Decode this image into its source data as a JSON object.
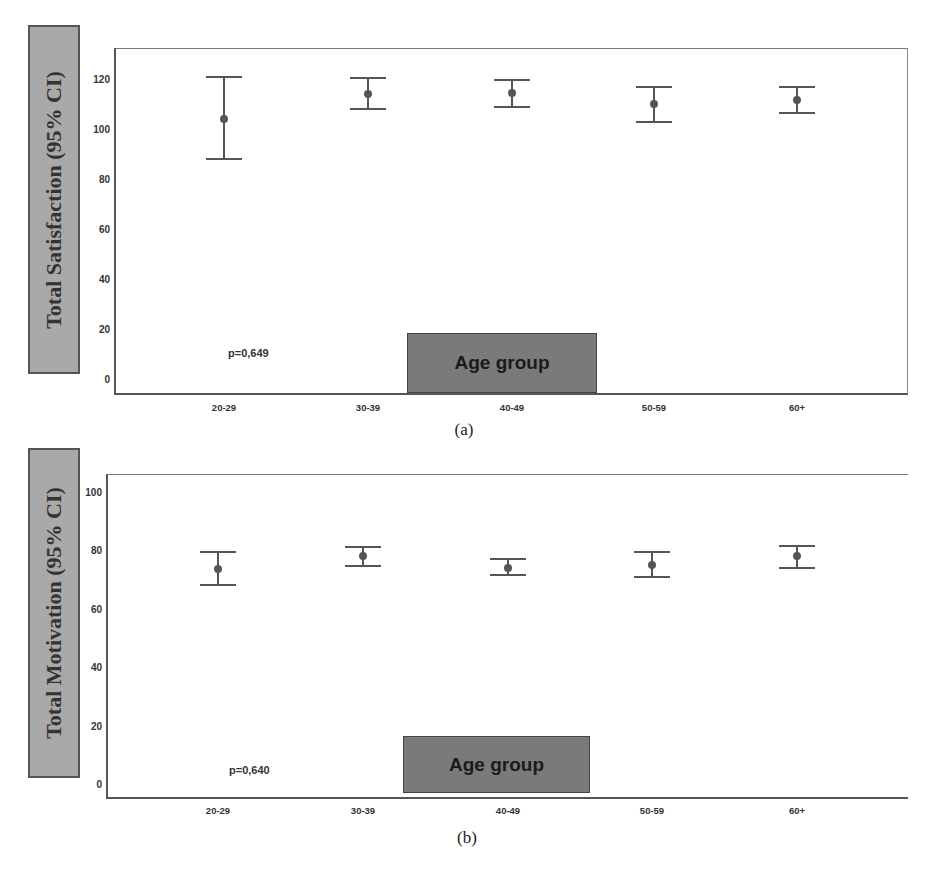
{
  "chart_data": [
    {
      "type": "errorbar",
      "panel_label": "(a)",
      "title": "",
      "xlabel": "Age group",
      "ylabel": "Total Satisfaction (95% CI)",
      "categories": [
        "20-29",
        "30-39",
        "40-49",
        "50-59",
        "60+"
      ],
      "means": [
        104,
        114,
        114.5,
        110,
        111.5
      ],
      "ci_lower": [
        88,
        108,
        109,
        103,
        106.5
      ],
      "ci_upper": [
        121,
        120.5,
        119.5,
        117,
        117
      ],
      "yticks": [
        "0",
        "20",
        "40",
        "60",
        "80",
        "100",
        "120"
      ],
      "ylim": [
        -6,
        132
      ],
      "annotation": "p=0,649",
      "grid": false,
      "legend": null
    },
    {
      "type": "errorbar",
      "panel_label": "(b)",
      "title": "",
      "xlabel": "Age group",
      "ylabel": "Total Motivation (95% CI)",
      "categories": [
        "20-29",
        "30-39",
        "40-49",
        "50-59",
        "60+"
      ],
      "means": [
        73.5,
        78,
        74,
        75,
        78
      ],
      "ci_lower": [
        68,
        74.5,
        71.5,
        71,
        74
      ],
      "ci_upper": [
        79.5,
        81,
        77,
        79.5,
        81.5
      ],
      "yticks": [
        "0",
        "20",
        "40",
        "60",
        "80",
        "100"
      ],
      "ylim": [
        -5,
        106
      ],
      "annotation": "p=0,640",
      "grid": false,
      "legend": null
    }
  ]
}
